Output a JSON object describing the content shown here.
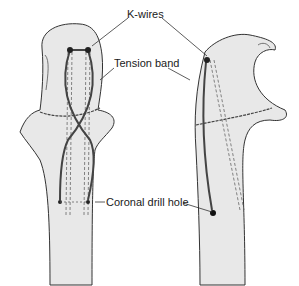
{
  "figure": {
    "views": [
      {
        "id": "anterior",
        "position": "left"
      },
      {
        "id": "lateral",
        "position": "right"
      }
    ]
  },
  "labels": {
    "k_wires": "K-wires",
    "tension_band": "Tension band",
    "coronal_drill_hole": "Coronal drill hole"
  },
  "colors": {
    "bone_fill": "#e8e8e8",
    "outline": "#333333",
    "wire": "#555555",
    "background": "#ffffff"
  }
}
